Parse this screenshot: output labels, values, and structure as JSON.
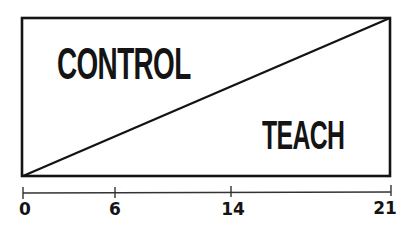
{
  "diagram": {
    "labels": {
      "upper_left": "CONTROL",
      "lower_right": "TEACH"
    },
    "axis": {
      "ticks": [
        {
          "value": "0",
          "x": 23
        },
        {
          "value": "6",
          "x": 115
        },
        {
          "value": "14",
          "x": 231
        },
        {
          "value": "21",
          "x": 391
        }
      ]
    },
    "colors": {
      "stroke": "#141414",
      "background": "#ffffff"
    }
  }
}
